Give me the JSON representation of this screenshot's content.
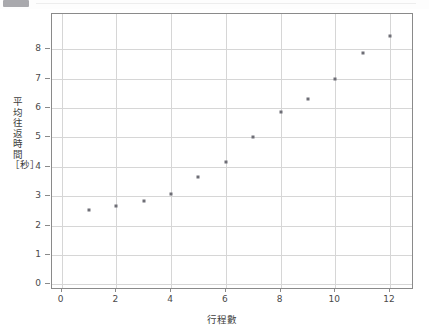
{
  "window": {
    "chrome_visible": true
  },
  "chart_data": {
    "type": "scatter",
    "title": "",
    "xlabel": "行程數",
    "ylabel": "平均往返時間［秒］",
    "xlim": [
      -0.35,
      12.8
    ],
    "ylim": [
      -0.12,
      9.2
    ],
    "grid": true,
    "legend": null,
    "xticks": [
      0,
      2,
      4,
      6,
      8,
      10,
      12
    ],
    "yticks": [
      0,
      1,
      2,
      3,
      4,
      5,
      6,
      7,
      8
    ],
    "xtick_labels": [
      "0",
      "2",
      "4",
      "6",
      "8",
      "10",
      "12"
    ],
    "ytick_labels": [
      "0",
      "1",
      "2",
      "3",
      "4",
      "5",
      "6",
      "7",
      "8"
    ],
    "marker": "square",
    "marker_color": "#6e6e76",
    "x": [
      1,
      2,
      3,
      4,
      5,
      6,
      7,
      8,
      9,
      10,
      11,
      12
    ],
    "y": [
      2.52,
      2.68,
      2.83,
      3.09,
      3.65,
      4.18,
      5.0,
      5.86,
      6.3,
      7.0,
      7.87,
      8.44
    ],
    "points": [
      {
        "x": 1,
        "y": 2.52
      },
      {
        "x": 2,
        "y": 2.68
      },
      {
        "x": 3,
        "y": 2.83
      },
      {
        "x": 4,
        "y": 3.09
      },
      {
        "x": 5,
        "y": 3.65
      },
      {
        "x": 6,
        "y": 4.18
      },
      {
        "x": 7,
        "y": 5.0
      },
      {
        "x": 8,
        "y": 5.86
      },
      {
        "x": 9,
        "y": 6.3
      },
      {
        "x": 10,
        "y": 7.0
      },
      {
        "x": 11,
        "y": 7.87
      },
      {
        "x": 12,
        "y": 8.44
      }
    ],
    "colors": {
      "axis": "#8a8a8a",
      "grid": "#d6d6d6",
      "marker": "#6e6e76",
      "text": "#3d3d3d",
      "background": "#ffffff"
    }
  }
}
